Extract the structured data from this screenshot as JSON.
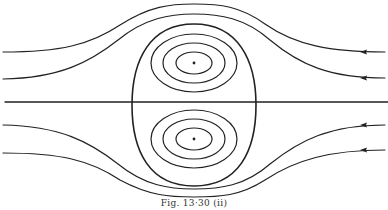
{
  "figure": {
    "caption": "Fig. 13·30 (ii)",
    "stroke_color": "#222222",
    "background": "#ffffff",
    "elements": {
      "centerline": {
        "y": 102,
        "x_start": 5,
        "x_end": 388
      },
      "separatrix_oval": {
        "cx": 194,
        "cy": 105,
        "rx": 62,
        "ry": 81
      },
      "vortices": [
        {
          "name": "upper",
          "cx": 194,
          "cy": 63,
          "rings": 3,
          "has_center_dot": true
        },
        {
          "name": "lower",
          "cx": 194,
          "cy": 139,
          "rings": 3,
          "has_center_dot": true
        }
      ],
      "streamlines": [
        {
          "name": "upper-outer",
          "left_y": 52,
          "right_y": 52,
          "apex_y": 4,
          "arrow": "left"
        },
        {
          "name": "upper-inner",
          "left_y": 79,
          "right_y": 78,
          "apex_y": 14,
          "arrow": "left"
        },
        {
          "name": "lower-inner",
          "left_y": 125,
          "right_y": 125,
          "apex_y": 189,
          "arrow": "left"
        },
        {
          "name": "lower-outer",
          "left_y": 153,
          "right_y": 150,
          "apex_y": 197,
          "arrow": "left"
        }
      ],
      "flow_direction": "right-to-left"
    }
  }
}
